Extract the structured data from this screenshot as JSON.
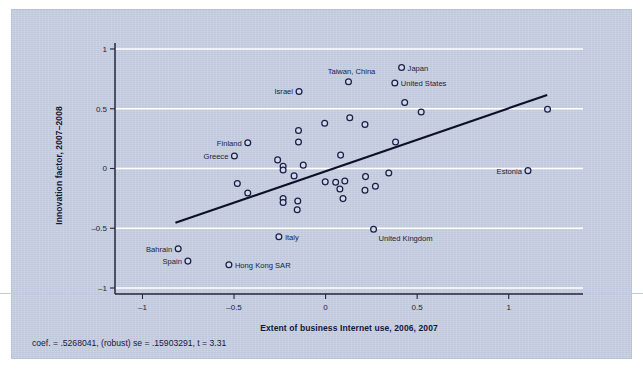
{
  "chart_data": {
    "type": "scatter",
    "title": "",
    "xlabel": "Extent of business Internet use, 2006, 2007",
    "ylabel": "Innovation factor, 2007–2008",
    "xlim": [
      -1.15,
      1.28
    ],
    "ylim": [
      -1.0,
      1.05
    ],
    "xticks": [
      -1,
      -0.5,
      0,
      0.5,
      1
    ],
    "xticklabels": [
      "–1",
      "–0.5",
      "0",
      "0.5",
      "1"
    ],
    "yticks": [
      1,
      0.5,
      0,
      -0.5,
      -1
    ],
    "yticklabels": [
      "1",
      "0.5",
      "0",
      "–0.5",
      "–1"
    ],
    "grid": "horizontal-white",
    "legend": "none",
    "annotation": "coef. = .5268041, (robust) se = .15903291, t = 3.31",
    "fit_line": {
      "type": "linear-fit",
      "slope": 0.5268041,
      "x_start": -0.82,
      "y_start": -0.455,
      "x_end": 1.21,
      "y_end": 0.615
    },
    "points": [
      {
        "label": "Japan",
        "x": 0.415,
        "y": 0.845,
        "label_pos": "right"
      },
      {
        "label": "United States",
        "x": 0.378,
        "y": 0.715,
        "label_pos": "right"
      },
      {
        "label": "Taiwan, China",
        "x": 0.125,
        "y": 0.725,
        "label_pos": "above-left"
      },
      {
        "label": "Israel",
        "x": -0.145,
        "y": 0.645,
        "label_pos": "left"
      },
      {
        "label": "Finland",
        "x": -0.425,
        "y": 0.215,
        "label_pos": "left"
      },
      {
        "label": "Greece",
        "x": -0.498,
        "y": 0.105,
        "label_pos": "left"
      },
      {
        "label": "Estonia",
        "x": 1.105,
        "y": -0.018,
        "label_pos": "left"
      },
      {
        "label": "United Kingdom",
        "x": 0.262,
        "y": -0.508,
        "label_pos": "below-right"
      },
      {
        "label": "Italy",
        "x": -0.255,
        "y": -0.572,
        "label_pos": "right"
      },
      {
        "label": "Bahrain",
        "x": -0.805,
        "y": -0.672,
        "label_pos": "left"
      },
      {
        "label": "Spain",
        "x": -0.752,
        "y": -0.775,
        "label_pos": "left"
      },
      {
        "label": "Hong Kong SAR",
        "x": -0.528,
        "y": -0.805,
        "label_pos": "right"
      },
      {
        "label": "",
        "x": 0.432,
        "y": 0.552
      },
      {
        "label": "",
        "x": 0.522,
        "y": 0.472
      },
      {
        "label": "",
        "x": 1.212,
        "y": 0.495
      },
      {
        "label": "",
        "x": 0.132,
        "y": 0.425
      },
      {
        "label": "",
        "x": 0.215,
        "y": 0.368
      },
      {
        "label": "",
        "x": -0.005,
        "y": 0.378
      },
      {
        "label": "",
        "x": -0.148,
        "y": 0.318
      },
      {
        "label": "",
        "x": -0.148,
        "y": 0.222
      },
      {
        "label": "",
        "x": 0.382,
        "y": 0.222
      },
      {
        "label": "",
        "x": 0.082,
        "y": 0.112
      },
      {
        "label": "",
        "x": -0.262,
        "y": 0.072
      },
      {
        "label": "",
        "x": -0.232,
        "y": 0.018
      },
      {
        "label": "",
        "x": -0.232,
        "y": -0.012
      },
      {
        "label": "",
        "x": -0.122,
        "y": 0.028
      },
      {
        "label": "",
        "x": -0.172,
        "y": -0.062
      },
      {
        "label": "",
        "x": 0.345,
        "y": -0.038
      },
      {
        "label": "",
        "x": 0.218,
        "y": -0.068
      },
      {
        "label": "",
        "x": -0.482,
        "y": -0.125
      },
      {
        "label": "",
        "x": -0.002,
        "y": -0.112
      },
      {
        "label": "",
        "x": 0.055,
        "y": -0.115
      },
      {
        "label": "",
        "x": 0.105,
        "y": -0.105
      },
      {
        "label": "",
        "x": 0.272,
        "y": -0.148
      },
      {
        "label": "",
        "x": 0.078,
        "y": -0.172
      },
      {
        "label": "",
        "x": 0.215,
        "y": -0.182
      },
      {
        "label": "",
        "x": -0.425,
        "y": -0.205
      },
      {
        "label": "",
        "x": 0.095,
        "y": -0.252
      },
      {
        "label": "",
        "x": -0.232,
        "y": -0.252
      },
      {
        "label": "",
        "x": -0.232,
        "y": -0.285
      },
      {
        "label": "",
        "x": -0.152,
        "y": -0.272
      },
      {
        "label": "",
        "x": -0.155,
        "y": -0.345
      }
    ]
  },
  "colors": {
    "panel_background": "#c3cce0",
    "marker_stroke": "#1a1f46",
    "marker_fill": "#d2d9ea",
    "gridline": "#ffffff",
    "axis": "#23263f",
    "fit_line": "#0d0f26",
    "text": "#1b1d3c"
  }
}
